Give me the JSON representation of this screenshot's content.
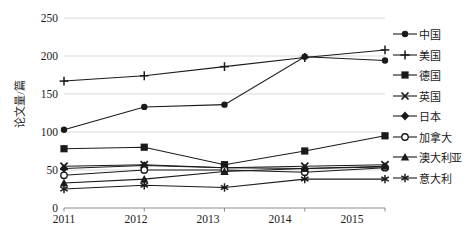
{
  "chart_data": {
    "type": "line",
    "title": "",
    "xlabel": "",
    "ylabel": "论文量/篇",
    "x": [
      "2011",
      "2012",
      "2013",
      "2014",
      "2015"
    ],
    "categories": [
      "2011",
      "2012",
      "2013",
      "2014",
      "2015"
    ],
    "ylim": [
      0,
      250
    ],
    "yticks": [
      0,
      50,
      100,
      150,
      200,
      250
    ],
    "ytick_labels": [
      "0",
      "50",
      "100",
      "150",
      "200",
      "250"
    ],
    "grid": "horizontal",
    "legend_position": "right",
    "series": [
      {
        "name": "中国",
        "marker": "filled-circle",
        "values": [
          103,
          133,
          136,
          199,
          194
        ],
        "color": "#1a1a1a"
      },
      {
        "name": "美国",
        "marker": "plus",
        "values": [
          167,
          174,
          186,
          198,
          208
        ],
        "color": "#1a1a1a"
      },
      {
        "name": "德国",
        "marker": "filled-square",
        "values": [
          78,
          80,
          57,
          75,
          95
        ],
        "color": "#1a1a1a"
      },
      {
        "name": "英国",
        "marker": "cross",
        "values": [
          55,
          57,
          53,
          55,
          57
        ],
        "color": "#1a1a1a"
      },
      {
        "name": "日本",
        "marker": "filled-diamond",
        "values": [
          52,
          56,
          53,
          52,
          54
        ],
        "color": "#1a1a1a"
      },
      {
        "name": "加拿大",
        "marker": "open-circle",
        "values": [
          43,
          50,
          50,
          47,
          53
        ],
        "color": "#1a1a1a"
      },
      {
        "name": "澳大利亚",
        "marker": "filled-triangle",
        "values": [
          33,
          38,
          48,
          52,
          55
        ],
        "color": "#1a1a1a"
      },
      {
        "name": "意大利",
        "marker": "asterisk",
        "values": [
          25,
          30,
          27,
          38,
          38
        ],
        "color": "#1a1a1a"
      }
    ]
  },
  "axis": {
    "y_title": "论文量/篇",
    "y_labels": [
      "250",
      "200",
      "150",
      "100",
      "50",
      "0"
    ],
    "x_labels": [
      "2011",
      "2012",
      "2013",
      "2014",
      "2015"
    ]
  },
  "legend": {
    "items": [
      {
        "label": "中国"
      },
      {
        "label": "美国"
      },
      {
        "label": "德国"
      },
      {
        "label": "英国"
      },
      {
        "label": "日本"
      },
      {
        "label": "加拿大"
      },
      {
        "label": "澳大利亚"
      },
      {
        "label": "意大利"
      }
    ]
  },
  "style": {
    "line_color": "#1a1a1a",
    "grid_color": "#d9d9d9",
    "axis_color": "#8c8c8c",
    "background": "#ffffff"
  }
}
